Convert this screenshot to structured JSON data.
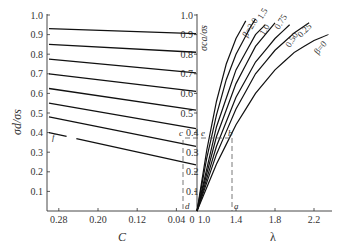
{
  "chart_data": [
    {
      "panel": "left",
      "type": "line",
      "title": "",
      "xlabel": "C",
      "ylabel": "σd/σs",
      "x_reversed": true,
      "xlim": [
        0.3,
        0.0
      ],
      "ylim": [
        0,
        1.0
      ],
      "xticks": [
        "0.28",
        "0.20",
        "0.12",
        "0.04"
      ],
      "yticks": [
        "0.1",
        "0.2",
        "0.3",
        "0.4",
        "0.5",
        "0.6",
        "0.7",
        "0.8",
        "0.9",
        "1.0"
      ],
      "grid": false,
      "series": [
        {
          "name": "line1",
          "x": [
            0.3,
            0.0
          ],
          "values": [
            0.93,
            0.905
          ]
        },
        {
          "name": "line2",
          "x": [
            0.3,
            0.0
          ],
          "values": [
            0.85,
            0.81
          ]
        },
        {
          "name": "line3",
          "x": [
            0.3,
            0.0
          ],
          "values": [
            0.775,
            0.705
          ]
        },
        {
          "name": "line4",
          "x": [
            0.3,
            0.0
          ],
          "values": [
            0.7,
            0.61
          ]
        },
        {
          "name": "line5",
          "x": [
            0.3,
            0.0
          ],
          "values": [
            0.625,
            0.515
          ]
        },
        {
          "name": "line6",
          "x": [
            0.3,
            0.0
          ],
          "values": [
            0.55,
            0.42
          ]
        },
        {
          "name": "line7",
          "x": [
            0.3,
            0.0
          ],
          "values": [
            0.48,
            0.33
          ]
        },
        {
          "name": "line8",
          "x": [
            0.3,
            0.0
          ],
          "values": [
            0.4,
            0.235
          ]
        }
      ],
      "annotations": [
        {
          "label": "f",
          "x": 0.29,
          "y": 0.38
        },
        {
          "label": "d",
          "x": 0.02,
          "y": 0.0
        },
        {
          "label": "c",
          "x": 0.02,
          "y": 0.37
        }
      ]
    },
    {
      "panel": "right",
      "type": "line",
      "title": "",
      "xlabel": "λ",
      "ylabel": "σca/σs",
      "xlim": [
        1.0,
        2.4
      ],
      "ylim": [
        0,
        1.0
      ],
      "xticks": [
        "1.0",
        "1.4",
        "1.8",
        "2.2"
      ],
      "yticks": [
        "0.1",
        "0.2",
        "0.3",
        "0.4",
        "0.5",
        "0.6",
        "0.7",
        "0.8",
        "0.9",
        "1.0"
      ],
      "grid": false,
      "legend_inline": true,
      "series": [
        {
          "name": "β=2.0",
          "x": [
            1.0,
            1.1,
            1.2,
            1.3,
            1.4,
            1.5
          ],
          "values": [
            0,
            0.31,
            0.56,
            0.75,
            0.88,
            0.97
          ]
        },
        {
          "name": "1.5",
          "x": [
            1.0,
            1.1,
            1.2,
            1.3,
            1.4,
            1.55,
            1.6
          ],
          "values": [
            0,
            0.27,
            0.49,
            0.67,
            0.8,
            0.94,
            0.98
          ]
        },
        {
          "name": "1.0",
          "x": [
            1.0,
            1.2,
            1.4,
            1.6,
            1.7
          ],
          "values": [
            0,
            0.43,
            0.72,
            0.9,
            0.95
          ]
        },
        {
          "name": "0.75",
          "x": [
            1.0,
            1.2,
            1.4,
            1.6,
            1.8
          ],
          "values": [
            0,
            0.38,
            0.65,
            0.84,
            0.96
          ]
        },
        {
          "name": "0.50",
          "x": [
            1.0,
            1.2,
            1.4,
            1.6,
            1.8,
            1.95
          ],
          "values": [
            0,
            0.33,
            0.58,
            0.76,
            0.88,
            0.95
          ]
        },
        {
          "name": "0.25",
          "x": [
            1.0,
            1.2,
            1.4,
            1.6,
            1.8,
            2.0,
            2.15
          ],
          "values": [
            0,
            0.29,
            0.52,
            0.7,
            0.82,
            0.91,
            0.96
          ]
        },
        {
          "name": "β=0",
          "x": [
            1.0,
            1.2,
            1.4,
            1.6,
            1.8,
            2.0,
            2.2,
            2.35
          ],
          "values": [
            0,
            0.24,
            0.44,
            0.6,
            0.72,
            0.81,
            0.87,
            0.9
          ]
        }
      ],
      "annotations": [
        {
          "label": "a",
          "x": 1.35,
          "y": 0.0
        },
        {
          "label": "b",
          "x": 1.35,
          "y": 0.37
        },
        {
          "label": "e",
          "x": 1.0,
          "y": 0.37
        }
      ]
    }
  ],
  "labels": {
    "left_ylabel": "σd/σs",
    "right_ylabel": "σca/σs",
    "left_xlabel": "C",
    "right_xlabel": "λ",
    "shared_zero": "0",
    "right_x0": "1.0",
    "curve_labels": [
      "β=2.0",
      "1.5",
      "1.0",
      "0.75",
      "0.50",
      "0.25",
      "β=0"
    ],
    "pt_a": "a",
    "pt_b": "b",
    "pt_c": "c",
    "pt_d": "d",
    "pt_e": "e",
    "pt_f": "f"
  }
}
